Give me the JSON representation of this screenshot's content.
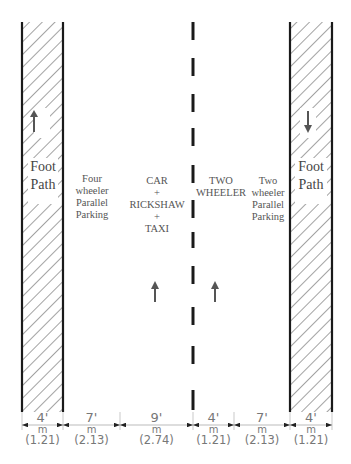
{
  "diagram": {
    "lanes": [
      {
        "id": "left-footpath",
        "label_lines": [
          "Foot",
          "Path"
        ],
        "width_ft": "4'",
        "unit": "m",
        "width_m": "(1.21)",
        "arrow": "up"
      },
      {
        "id": "four-wheeler-parking",
        "label_lines": [
          "Four",
          "wheeler",
          "Parallel",
          "Parking"
        ],
        "width_ft": "7'",
        "unit": "m",
        "width_m": "(2.13)"
      },
      {
        "id": "car-rickshaw-taxi",
        "label_lines": [
          "CAR",
          "+",
          "RICKSHAW",
          "+",
          "TAXI"
        ],
        "width_ft": "9'",
        "unit": "m",
        "width_m": "(2.74)",
        "arrow": "up"
      },
      {
        "id": "two-wheeler-lane",
        "label_lines": [
          "TWO",
          "WHEELER"
        ],
        "width_ft": "4'",
        "unit": "m",
        "width_m": "(1.21)",
        "arrow": "up"
      },
      {
        "id": "two-wheeler-parking",
        "label_lines": [
          "Two",
          "wheeler",
          "Parallel",
          "Parking"
        ],
        "width_ft": "7'",
        "unit": "m",
        "width_m": "(2.13)"
      },
      {
        "id": "right-footpath",
        "label_lines": [
          "Foot",
          "Path"
        ],
        "width_ft": "4'",
        "unit": "m",
        "width_m": "(1.21)",
        "arrow": "down"
      }
    ],
    "colors": {
      "line": "#1a1a1a",
      "hatch": "#555555",
      "text": "#555555",
      "dim": "#888888"
    }
  }
}
